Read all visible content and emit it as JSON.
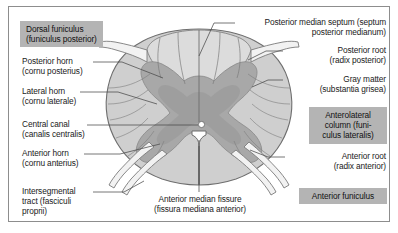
{
  "figure": {
    "frame_border_color": "#8d8d8d",
    "background_color": "#ffffff"
  },
  "palette": {
    "white_matter": "#cfcfcf",
    "white_matter_outline": "#6e6e6e",
    "gray_matter": "#a8a8a8",
    "gray_matter_outline": "#8a8a8a",
    "dorsal_funiculus": "#dcdcdc",
    "nerve_root": "#f2f2f2",
    "nerve_root_outline": "#7a7a7a",
    "central_canal": "#ffffff",
    "leader_line": "#4a4a4a",
    "label_text": "#1a1a1a",
    "highlight_box": "#b4b4b4"
  },
  "labels": {
    "dorsal_funiculus": {
      "line1": "Dorsal funiculus",
      "line2": "(funiculus posterior)",
      "text": "Dorsal funiculus\n(funiculus posterior)",
      "highlighted": true
    },
    "posterior_horn": {
      "line1": "Posterior horn",
      "line2": "(cornu posterius)",
      "text": "Posterior horn\n(cornu posterius)",
      "highlighted": false
    },
    "lateral_horn": {
      "line1": "Lateral horn",
      "line2": "(cornu laterale)",
      "text": "Lateral horn\n(cornu laterale)",
      "highlighted": false
    },
    "central_canal": {
      "line1": "Central canal",
      "line2": "(canalis centralis)",
      "text": "Central canal\n(canalis centralis)",
      "highlighted": false
    },
    "anterior_horn": {
      "line1": "Anterior horn",
      "line2": "(cornu anterius)",
      "text": "Anterior horn\n(cornu anterius)",
      "highlighted": false
    },
    "intersegmental_tract": {
      "line1": "Intersegmental",
      "line2": "tract (fasciculi",
      "line3": "proprii)",
      "text": "Intersegmental\ntract (fasciculi\nproprii)",
      "highlighted": false
    },
    "posterior_median_septum": {
      "line1": "Posterior median septum (septum",
      "line2": "posterior medianum)",
      "text": "Posterior median septum (septum\nposterior medianum)",
      "highlighted": false
    },
    "posterior_root": {
      "line1": "Posterior root",
      "line2": "(radix posterior)",
      "text": "Posterior root\n(radix posterior)",
      "highlighted": false
    },
    "gray_matter": {
      "line1": "Gray matter",
      "line2": "(substantia grisea)",
      "text": "Gray matter\n(substantia grisea)",
      "highlighted": false
    },
    "anterolateral_column": {
      "line1": "Anterolateral",
      "line2": "column (funi-",
      "line3": "culus lateralis)",
      "text": "Anterolateral\ncolumn (funi-\nculus lateralis)",
      "highlighted": true
    },
    "anterior_root": {
      "line1": "Anterior root",
      "line2": "(radix anterior)",
      "text": "Anterior root\n(radix anterior)",
      "highlighted": false
    },
    "anterior_funiculus": {
      "line1": "Anterior funiculus",
      "text": "Anterior funiculus",
      "highlighted": true
    },
    "anterior_median_fissure": {
      "line1": "Anterior median fissure",
      "line2": "(fissura mediana anterior)",
      "text": "Anterior median fissure\n(fissura mediana anterior)",
      "highlighted": false
    }
  }
}
